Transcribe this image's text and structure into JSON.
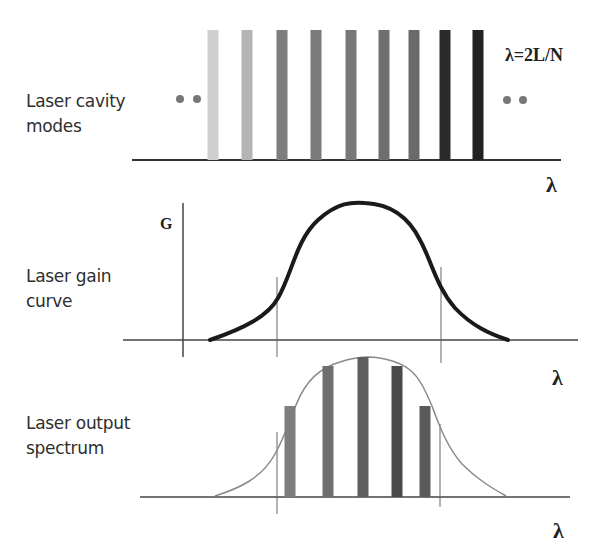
{
  "panels": {
    "cavity": {
      "label_line1": "Laser cavity",
      "label_line2": "modes",
      "formula": "λ=2L/N",
      "axis_label": "λ",
      "ellipsis_left": "dots",
      "ellipsis_right": "dots",
      "modes": [
        {
          "x": 213,
          "color": "#cfcfcf"
        },
        {
          "x": 247,
          "color": "#b4b4b4"
        },
        {
          "x": 282,
          "color": "#7d7d7d"
        },
        {
          "x": 316,
          "color": "#7a7a7a"
        },
        {
          "x": 351,
          "color": "#787878"
        },
        {
          "x": 384,
          "color": "#6f6f6f"
        },
        {
          "x": 414,
          "color": "#6a6a6a"
        },
        {
          "x": 445,
          "color": "#2b2b2b"
        },
        {
          "x": 478,
          "color": "#222222"
        }
      ]
    },
    "gain": {
      "label_line1": "Laser gain",
      "label_line2": "curve",
      "y_axis_label": "G",
      "axis_label": "λ"
    },
    "output": {
      "label_line1": "Laser output",
      "label_line2": "spectrum",
      "axis_label": "λ",
      "lines": [
        {
          "x": 290,
          "top": 406,
          "color": "#7e7e7e"
        },
        {
          "x": 328,
          "top": 366,
          "color": "#6e6e6e"
        },
        {
          "x": 363,
          "top": 357,
          "color": "#5e5e5e"
        },
        {
          "x": 397,
          "top": 366,
          "color": "#4a4a4a"
        },
        {
          "x": 425,
          "top": 406,
          "color": "#5a5a5a"
        }
      ]
    }
  },
  "chart_data": {
    "type": "diagram",
    "panels": [
      {
        "name": "Laser cavity modes",
        "xlabel": "λ",
        "annotation": "λ=2L/N",
        "mode_count_visible": 9,
        "equal_heights": true
      },
      {
        "name": "Laser gain curve",
        "ylabel": "G",
        "xlabel": "λ",
        "shape": "bell",
        "threshold_markers": 2
      },
      {
        "name": "Laser output spectrum",
        "xlabel": "λ",
        "lasing_modes": 5,
        "relative_heights": [
          0.65,
          0.93,
          1.0,
          0.93,
          0.65
        ]
      }
    ]
  }
}
